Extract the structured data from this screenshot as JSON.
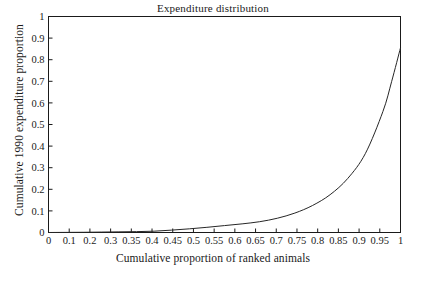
{
  "chart_data": {
    "type": "line",
    "title": "Expenditure distribution",
    "xlabel": "Cumulative proportion of ranked animals",
    "ylabel": "Cumulative 1990 expenditure proportion",
    "xlim": [
      0,
      1
    ],
    "ylim": [
      0,
      1
    ],
    "grid": false,
    "legend": null,
    "xtick_labels": [
      "0",
      "0.1",
      "0.2",
      "0.3",
      "0.35",
      "0.4",
      "0.45",
      "0.5",
      "0.55",
      "0.6",
      "0.65",
      "0.7",
      "0.75",
      "0.8",
      "0.85",
      "0.9",
      "0.95",
      "1"
    ],
    "ytick_labels": [
      "0",
      "0.1",
      "0.2",
      "0.3",
      "0.4",
      "0.5",
      "0.6",
      "0.7",
      "0.8",
      "0.9",
      "1"
    ],
    "ytick_values": [
      0,
      0.1,
      0.2,
      0.3,
      0.4,
      0.5,
      0.6,
      0.7,
      0.8,
      0.9,
      1
    ],
    "line_color": "#262626",
    "series": [
      {
        "name": "Cumulative expenditure",
        "x": [
          0,
          0.05,
          0.1,
          0.15,
          0.2,
          0.25,
          0.3,
          0.35,
          0.4,
          0.45,
          0.5,
          0.55,
          0.6,
          0.65,
          0.7,
          0.75,
          0.8,
          0.85,
          0.9,
          0.95,
          0.975,
          1
        ],
        "values": [
          0,
          0.0005,
          0.001,
          0.002,
          0.003,
          0.004,
          0.006,
          0.011,
          0.017,
          0.024,
          0.032,
          0.04,
          0.05,
          0.066,
          0.09,
          0.125,
          0.175,
          0.25,
          0.365,
          0.56,
          0.7,
          0.855
        ]
      }
    ]
  }
}
